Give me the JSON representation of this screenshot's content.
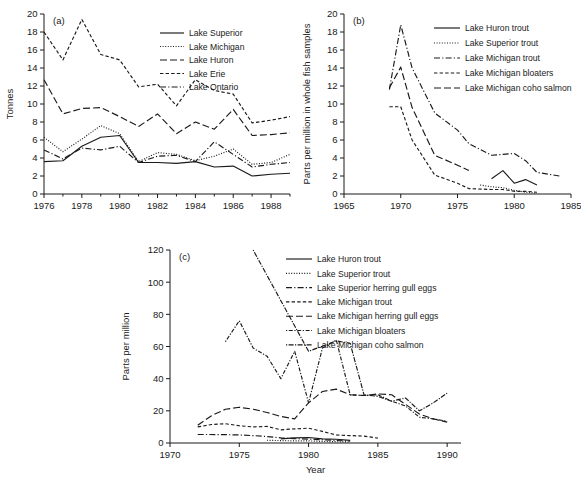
{
  "figure": {
    "panels": [
      "a",
      "b",
      "c"
    ],
    "xlabel_shared": "Year"
  },
  "chart_data": [
    {
      "type": "line",
      "panel": "a",
      "title": "",
      "xlabel": "",
      "ylabel": "Tonnes",
      "xlim": [
        1976,
        1989
      ],
      "ylim": [
        0,
        20
      ],
      "xticks": [
        1976,
        1978,
        1980,
        1982,
        1984,
        1986,
        1988
      ],
      "xtick_labels": [
        "1976",
        "1978",
        "1980",
        "1982",
        "1984",
        "1986",
        "1988"
      ],
      "yticks": [
        0,
        2,
        4,
        6,
        8,
        10,
        12,
        14,
        16,
        18,
        20
      ],
      "ytick_labels": [
        "0",
        "2",
        "4",
        "6",
        "8",
        "10",
        "12",
        "14",
        "16",
        "18",
        "20"
      ],
      "minor_xticks": true,
      "grid": false,
      "legend_position": "top-right",
      "x": [
        1976,
        1977,
        1978,
        1979,
        1980,
        1981,
        1982,
        1983,
        1984,
        1985,
        1986,
        1987,
        1988,
        1989
      ],
      "series": [
        {
          "name": "Lake Superior",
          "dash": "solid",
          "values": [
            3.6,
            3.7,
            5.3,
            6.3,
            6.5,
            3.5,
            3.5,
            3.4,
            3.6,
            3.0,
            3.1,
            2.0,
            2.2,
            2.3
          ]
        },
        {
          "name": "Lake Michigan",
          "dash": "dotted",
          "values": [
            6.3,
            4.7,
            6.1,
            7.6,
            6.7,
            3.6,
            4.6,
            4.4,
            3.7,
            4.2,
            5.0,
            3.3,
            3.5,
            4.4
          ]
        },
        {
          "name": "Lake Huron",
          "dash": "dashed",
          "values": [
            12.7,
            8.9,
            9.5,
            9.6,
            8.6,
            7.5,
            8.9,
            6.7,
            8.0,
            7.2,
            9.4,
            6.5,
            6.6,
            6.8
          ]
        },
        {
          "name": "Lake Erie",
          "dash": "dashed-fine",
          "values": [
            18.0,
            14.9,
            19.4,
            15.5,
            14.9,
            11.9,
            12.2,
            9.8,
            12.7,
            11.5,
            11.1,
            7.9,
            8.2,
            8.6
          ]
        },
        {
          "name": "Lake Ontario",
          "dash": "dash-dot",
          "values": [
            4.9,
            3.9,
            5.1,
            4.9,
            5.3,
            3.5,
            4.2,
            4.3,
            3.6,
            5.8,
            4.4,
            3.0,
            3.3,
            3.5
          ]
        }
      ]
    },
    {
      "type": "line",
      "panel": "b",
      "title": "",
      "xlabel": "",
      "ylabel": "Parts per million in whole fish samples",
      "xlim": [
        1965,
        1985
      ],
      "ylim": [
        0,
        20
      ],
      "xticks": [
        1965,
        1970,
        1975,
        1980,
        1985
      ],
      "xtick_labels": [
        "1965",
        "1970",
        "1975",
        "1980",
        "1985"
      ],
      "yticks": [
        0,
        2,
        4,
        6,
        8,
        10,
        12,
        14,
        16,
        18,
        20
      ],
      "ytick_labels": [
        "0",
        "2",
        "4",
        "6",
        "8",
        "10",
        "12",
        "14",
        "16",
        "18",
        "20"
      ],
      "grid": false,
      "legend_position": "top-right",
      "series": [
        {
          "name": "Lake Huron trout",
          "dash": "solid",
          "x": [
            1978,
            1979,
            1980,
            1981,
            1982
          ],
          "values": [
            1.7,
            2.6,
            1.2,
            1.6,
            1.0
          ]
        },
        {
          "name": "Lake Superior trout",
          "dash": "dotted",
          "x": [
            1977,
            1978,
            1979,
            1980,
            1981,
            1982
          ],
          "values": [
            1.0,
            0.8,
            0.7,
            0.4,
            0.2,
            0.1
          ]
        },
        {
          "name": "Lake Michigan trout",
          "dash": "dash-dot",
          "x": [
            1969,
            1970,
            1971,
            1973,
            1975,
            1976,
            1978,
            1979,
            1980,
            1981,
            1982,
            1984
          ],
          "values": [
            11.6,
            18.8,
            14.0,
            9.0,
            7.1,
            5.6,
            4.3,
            4.4,
            4.5,
            3.7,
            2.4,
            2.0
          ]
        },
        {
          "name": "Lake Michigan bloaters",
          "dash": "dashed-fine",
          "x": [
            1969,
            1970,
            1971,
            1973,
            1975,
            1976,
            1978,
            1979,
            1980,
            1981,
            1982
          ],
          "values": [
            9.7,
            9.7,
            6.0,
            2.1,
            1.2,
            0.6,
            0.5,
            0.5,
            0.3,
            0.3,
            0.2
          ]
        },
        {
          "name": "Lake Michigan coho salmon",
          "dash": "dashed",
          "x": [
            1969,
            1970,
            1971,
            1973,
            1975,
            1976
          ],
          "values": [
            11.8,
            14.1,
            9.6,
            4.3,
            3.2,
            2.6
          ]
        }
      ]
    },
    {
      "type": "line",
      "panel": "c",
      "title": "",
      "xlabel": "Year",
      "ylabel": "Parts per million",
      "xlim": [
        1970,
        1991
      ],
      "ylim": [
        0,
        120
      ],
      "xticks": [
        1970,
        1975,
        1980,
        1985,
        1990
      ],
      "xtick_labels": [
        "1970",
        "1975",
        "1980",
        "1985",
        "1990"
      ],
      "yticks": [
        0,
        20,
        40,
        60,
        80,
        100,
        120
      ],
      "ytick_labels": [
        "0",
        "20",
        "40",
        "60",
        "80",
        "100",
        "120"
      ],
      "grid": false,
      "legend_position": "top-right",
      "series": [
        {
          "name": "Lake Huron trout",
          "dash": "solid",
          "x": [
            1978,
            1979,
            1980,
            1981,
            1982,
            1983
          ],
          "values": [
            2.6,
            3.2,
            3.4,
            2.6,
            2.3,
            1.6
          ]
        },
        {
          "name": "Lake Superior trout",
          "dash": "dotted",
          "x": [
            1977,
            1978,
            1979,
            1980,
            1981,
            1982,
            1983
          ],
          "values": [
            1.7,
            1.5,
            1.3,
            1.3,
            1.0,
            0.8,
            0.6
          ]
        },
        {
          "name": "Lake Superior herring gull eggs",
          "dash": "dash-dot",
          "x": [
            1972,
            1974,
            1975,
            1976,
            1977,
            1978,
            1979,
            1980,
            1981,
            1982,
            1983
          ],
          "values": [
            5.3,
            5.2,
            5.0,
            4.6,
            4.0,
            3.2,
            2.7,
            2.4,
            2.0,
            1.6,
            1.2
          ]
        },
        {
          "name": "Lake Michigan trout",
          "dash": "dashed-fine",
          "x": [
            1972,
            1973,
            1974,
            1975,
            1976,
            1977,
            1978,
            1979,
            1980,
            1981,
            1982,
            1983,
            1984,
            1985
          ],
          "values": [
            10.0,
            11.5,
            12.0,
            10.7,
            10.0,
            10.3,
            8.2,
            8.8,
            9.2,
            7.2,
            5.0,
            4.6,
            4.3,
            3.0
          ]
        },
        {
          "name": "Lake Michigan herring gull eggs",
          "dash": "dashed",
          "x": [
            1972,
            1973,
            1974,
            1975,
            1976,
            1977,
            1978,
            1979,
            1980,
            1981,
            1982,
            1983,
            1984,
            1985,
            1986,
            1987,
            1988,
            1989,
            1990
          ],
          "values": [
            11.0,
            17.0,
            21.0,
            22.2,
            21.0,
            19.0,
            16.5,
            15.0,
            25.0,
            32.0,
            33.5,
            30.0,
            29.5,
            30.5,
            30.0,
            24.0,
            18.0,
            15.0,
            13.0
          ]
        },
        {
          "name": "Lake Michigan bloaters",
          "dash": "dash-dot-fine",
          "x": [
            1974,
            1975,
            1976,
            1977,
            1978,
            1979,
            1980,
            1981,
            1982,
            1983,
            1984,
            1985,
            1986,
            1987,
            1988,
            1989,
            1990
          ],
          "values": [
            63.0,
            76.0,
            59.0,
            54.0,
            40.0,
            57.0,
            25.0,
            59.0,
            64.0,
            30.0,
            29.5,
            30.0,
            26.0,
            23.0,
            16.0,
            15.0,
            13.5
          ]
        },
        {
          "name": "Lake Michigan coho salmon",
          "dash": "dashed-dotted",
          "x": [
            1976,
            1980,
            1982,
            1983,
            1984,
            1985,
            1986,
            1987,
            1988,
            1989,
            1990
          ],
          "values": [
            120.0,
            57.0,
            63.5,
            62.0,
            30.0,
            29.0,
            26.0,
            28.0,
            20.0,
            25.0,
            31.0
          ]
        }
      ]
    }
  ]
}
